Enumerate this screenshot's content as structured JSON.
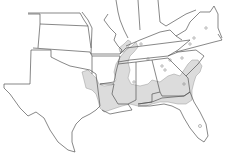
{
  "map": {
    "type": "species range map",
    "region": "Southeastern United States",
    "colors": {
      "background": "#ffffff",
      "state_border": "#555555",
      "range_fill": "#dcdcdc",
      "range_border": "#999999"
    },
    "states_visible": [
      "Kansas",
      "Oklahoma",
      "Texas",
      "Missouri",
      "Arkansas",
      "Louisiana",
      "Mississippi",
      "Alabama",
      "Georgia",
      "Florida",
      "South Carolina",
      "North Carolina",
      "Tennessee",
      "Kentucky",
      "Virginia",
      "West Virginia",
      "Illinois",
      "Indiana",
      "Ohio",
      "Maryland",
      "Delaware",
      "Colorado",
      "New Mexico",
      "Nebraska",
      "Iowa"
    ],
    "range_areas": [
      "Mississippi embayment (Arkansas/Tennessee/Mississippi)",
      "Gulf coastal plain (Louisiana to Georgia)",
      "Atlantic coastal plain (Georgia/South Carolina)",
      "East Texas / Oklahoma fringe"
    ],
    "isolated_records": 12
  }
}
